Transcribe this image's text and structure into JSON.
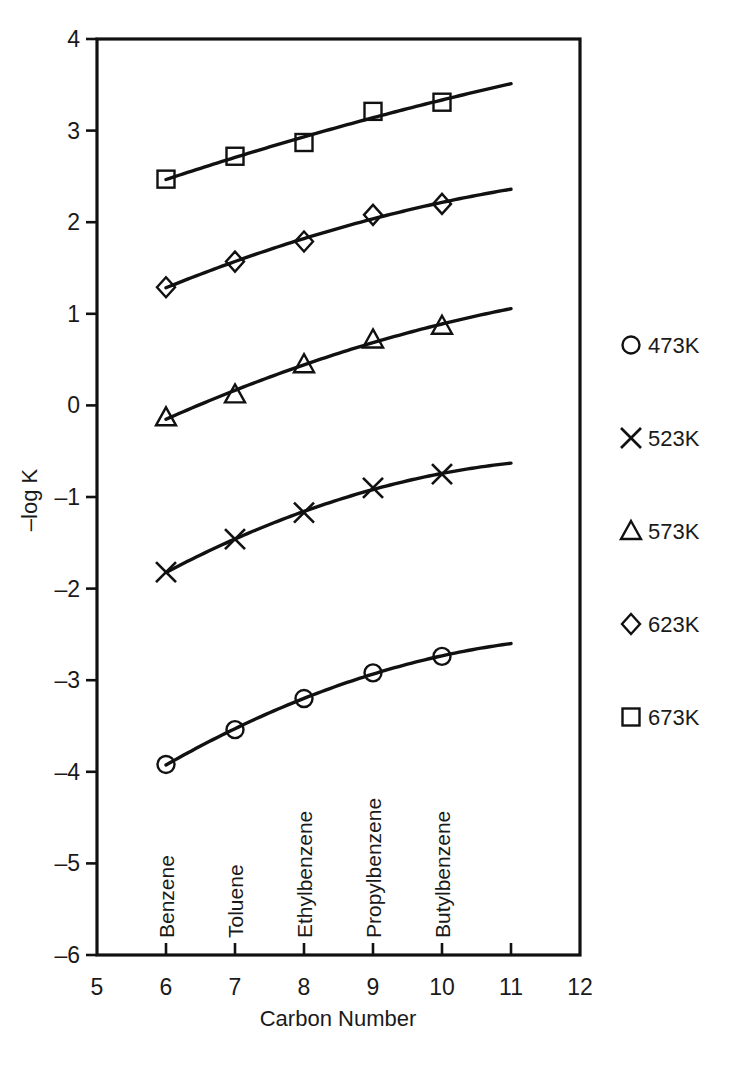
{
  "chart_data": {
    "type": "line",
    "title": "",
    "xlabel": "Carbon Number",
    "ylabel": "–log K",
    "xlim": [
      5,
      12
    ],
    "ylim": [
      -6,
      4
    ],
    "xticks": [
      "5",
      "6",
      "7",
      "8",
      "9",
      "10",
      "11",
      "12"
    ],
    "yticks": [
      "4",
      "3",
      "2",
      "1",
      "0",
      "–1",
      "–2",
      "–3",
      "–4",
      "–5",
      "–6"
    ],
    "grid": false,
    "legend_position": "right",
    "x": [
      6,
      7,
      8,
      9,
      10
    ],
    "categories": [
      "Benzene",
      "Toluene",
      "Ethylbenzene",
      "Propylbenzene",
      "Butylbenzene"
    ],
    "point_labels": [
      {
        "name": "Benzene",
        "carbon": 6
      },
      {
        "name": "Toluene",
        "carbon": 7
      },
      {
        "name": "Ethylbenzene",
        "carbon": 8
      },
      {
        "name": "Propylbenzene",
        "carbon": 9
      },
      {
        "name": "Butylbenzene",
        "carbon": 10
      }
    ],
    "series": [
      {
        "name": "473K",
        "marker": "circle",
        "values": [
          -3.92,
          -3.54,
          -3.2,
          -2.92,
          -2.74
        ],
        "fit_x": [
          6,
          11
        ],
        "fit_y": [
          -3.95,
          -2.46
        ]
      },
      {
        "name": "523K",
        "marker": "cross",
        "values": [
          -1.82,
          -1.46,
          -1.17,
          -0.9,
          -0.75
        ],
        "fit_x": [
          6,
          11
        ],
        "fit_y": [
          -1.84,
          -0.5
        ]
      },
      {
        "name": "573K",
        "marker": "triangle",
        "values": [
          -0.13,
          0.12,
          0.45,
          0.72,
          0.87
        ],
        "fit_x": [
          6,
          11
        ],
        "fit_y": [
          -0.15,
          1.09
        ]
      },
      {
        "name": "623K",
        "marker": "diamond",
        "values": [
          1.29,
          1.57,
          1.79,
          2.08,
          2.2
        ],
        "fit_x": [
          6,
          11
        ],
        "fit_y": [
          1.28,
          2.4
        ]
      },
      {
        "name": "673K",
        "marker": "square",
        "values": [
          2.47,
          2.72,
          2.87,
          3.21,
          3.31
        ],
        "fit_x": [
          6,
          11
        ],
        "fit_y": [
          2.45,
          3.49
        ]
      }
    ]
  },
  "legend": {
    "entries": [
      {
        "marker": "circle",
        "label": "473K"
      },
      {
        "marker": "cross",
        "label": "523K"
      },
      {
        "marker": "triangle",
        "label": "573K"
      },
      {
        "marker": "diamond",
        "label": "623K"
      },
      {
        "marker": "square",
        "label": "673K"
      }
    ]
  },
  "colors": {
    "ink": "#111111",
    "background": "#ffffff"
  }
}
